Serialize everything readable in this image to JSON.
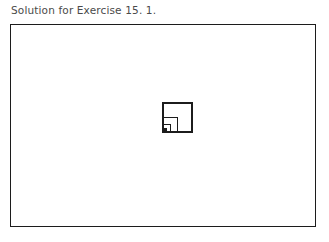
{
  "caption": {
    "text": "Solution for Exercise 15. 1."
  },
  "frame": {
    "x": 10,
    "y": 24,
    "width": 306,
    "height": 203,
    "stroke_color": "#1c1c1c",
    "stroke_width": 1,
    "background": "#ffffff"
  },
  "figure": {
    "name": "recursive-nested-squares",
    "origin_x": 163,
    "origin_y": 103,
    "outer_size": 29,
    "levels": 4,
    "scale_factor": 0.5,
    "anchor": "bottom-left",
    "stroke_color": "#1c1c1c",
    "stroke_width": 1.1,
    "fill_color": "#1c1c1c",
    "innermost_filled": true,
    "squares": [
      {
        "level": 1,
        "x": 0.0,
        "y": 0.0,
        "size": 29.0,
        "filled": false
      },
      {
        "level": 2,
        "x": 0.0,
        "y": 14.5,
        "size": 14.5,
        "filled": false
      },
      {
        "level": 3,
        "x": 0.0,
        "y": 21.75,
        "size": 7.25,
        "filled": false
      },
      {
        "level": 4,
        "x": 0.0,
        "y": 25.375,
        "size": 3.625,
        "filled": true
      }
    ]
  },
  "colors": {
    "page_background": "#ffffff",
    "ink": "#1c1c1c",
    "caption_text": "#4a4a4a"
  }
}
